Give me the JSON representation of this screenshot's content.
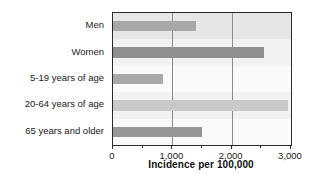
{
  "chart_data": {
    "type": "bar",
    "orientation": "horizontal",
    "title": "",
    "xlabel": "Incidence per 100,000",
    "ylabel": "",
    "categories": [
      "Men",
      "Women",
      "5-19 years of age",
      "20-64 years of age",
      "65 years and older"
    ],
    "values": [
      1400,
      2550,
      850,
      2950,
      1500
    ],
    "xlim": [
      0,
      3000
    ],
    "xticks": [
      0,
      1000,
      2000,
      3000
    ],
    "xticklabels": [
      "0",
      "1,000",
      "2,000",
      "3,000"
    ],
    "minor_xticks": [
      500,
      1500,
      2500
    ],
    "grid": "vertical-at-1000-and-2000",
    "gridlines": [
      1000,
      2000
    ],
    "legend": "none",
    "bar_colors": [
      "#a8a8a8",
      "#8f8f8f",
      "#a8a8a8",
      "#c9c9c9",
      "#969696"
    ],
    "band_colors": [
      "#e6e6e6",
      "#f2f2f2",
      "#fafafa",
      "#f2f2f2",
      "#fafafa"
    ],
    "axis_color": "#2b2b2b",
    "gridline_color": "#8c8c8c"
  },
  "axis": {
    "x_title": "Incidence per 100,000",
    "tick_labels": [
      "0",
      "1,000",
      "2,000",
      "3,000"
    ]
  },
  "categories": {
    "items": [
      {
        "label": "Men"
      },
      {
        "label": "Women"
      },
      {
        "label": "5-19 years of age"
      },
      {
        "label": "20-64 years of age"
      },
      {
        "label": "65 years and older"
      }
    ]
  }
}
